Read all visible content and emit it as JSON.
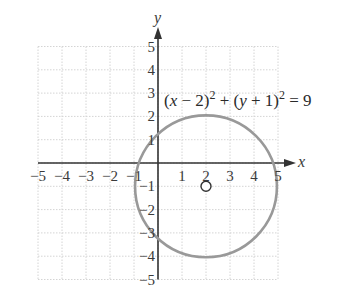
{
  "chart_data": {
    "type": "line",
    "title": "",
    "xlabel": "x",
    "ylabel": "y",
    "xlim": [
      -5,
      5
    ],
    "ylim": [
      -5,
      5
    ],
    "grid": true,
    "x_ticks": [
      "−5",
      "−4",
      "−3",
      "−2",
      "−1",
      "1",
      "2",
      "3",
      "4",
      "5"
    ],
    "y_ticks": [
      "5",
      "4",
      "3",
      "2",
      "1",
      "−1",
      "−2",
      "−3",
      "−4",
      "−5"
    ],
    "series": [
      {
        "name": "circle",
        "equation": "(x − 2)² + (y + 1)² = 9",
        "center": [
          2,
          -1
        ],
        "radius": 3,
        "color": "#999999"
      }
    ],
    "annotations": [
      {
        "text": "(x − 2)² + (y + 1)² = 9",
        "position": "upper right"
      },
      {
        "text": "center marker",
        "point": [
          2,
          -1
        ],
        "marker": "open-circle"
      }
    ]
  },
  "labels": {
    "x_axis": "x",
    "y_axis": "y",
    "equation_parts": {
      "p1": "(",
      "x": "x",
      "p2": " − 2)",
      "sup1": "2",
      "p3": " + (",
      "y": "y",
      "p4": " + 1)",
      "sup2": "2",
      "p5": " = 9"
    },
    "x_ticks": [
      {
        "label": "−5",
        "v": -5
      },
      {
        "label": "−4",
        "v": -4
      },
      {
        "label": "−3",
        "v": -3
      },
      {
        "label": "−2",
        "v": -2
      },
      {
        "label": "−1",
        "v": -1
      },
      {
        "label": "1",
        "v": 1
      },
      {
        "label": "2",
        "v": 2
      },
      {
        "label": "3",
        "v": 3
      },
      {
        "label": "4",
        "v": 4
      },
      {
        "label": "5",
        "v": 5
      }
    ],
    "y_ticks": [
      {
        "label": "5",
        "v": 5
      },
      {
        "label": "4",
        "v": 4
      },
      {
        "label": "3",
        "v": 3
      },
      {
        "label": "2",
        "v": 2
      },
      {
        "label": "1",
        "v": 1
      },
      {
        "label": "−1",
        "v": -1
      },
      {
        "label": "−2",
        "v": -2
      },
      {
        "label": "−3",
        "v": -3
      },
      {
        "label": "−4",
        "v": -4
      },
      {
        "label": "−5",
        "v": -5
      }
    ]
  },
  "colors": {
    "axis": "#333333",
    "grid": "#d4d4d4",
    "curve": "#9a9a9a",
    "text": "#3a3a3a"
  }
}
